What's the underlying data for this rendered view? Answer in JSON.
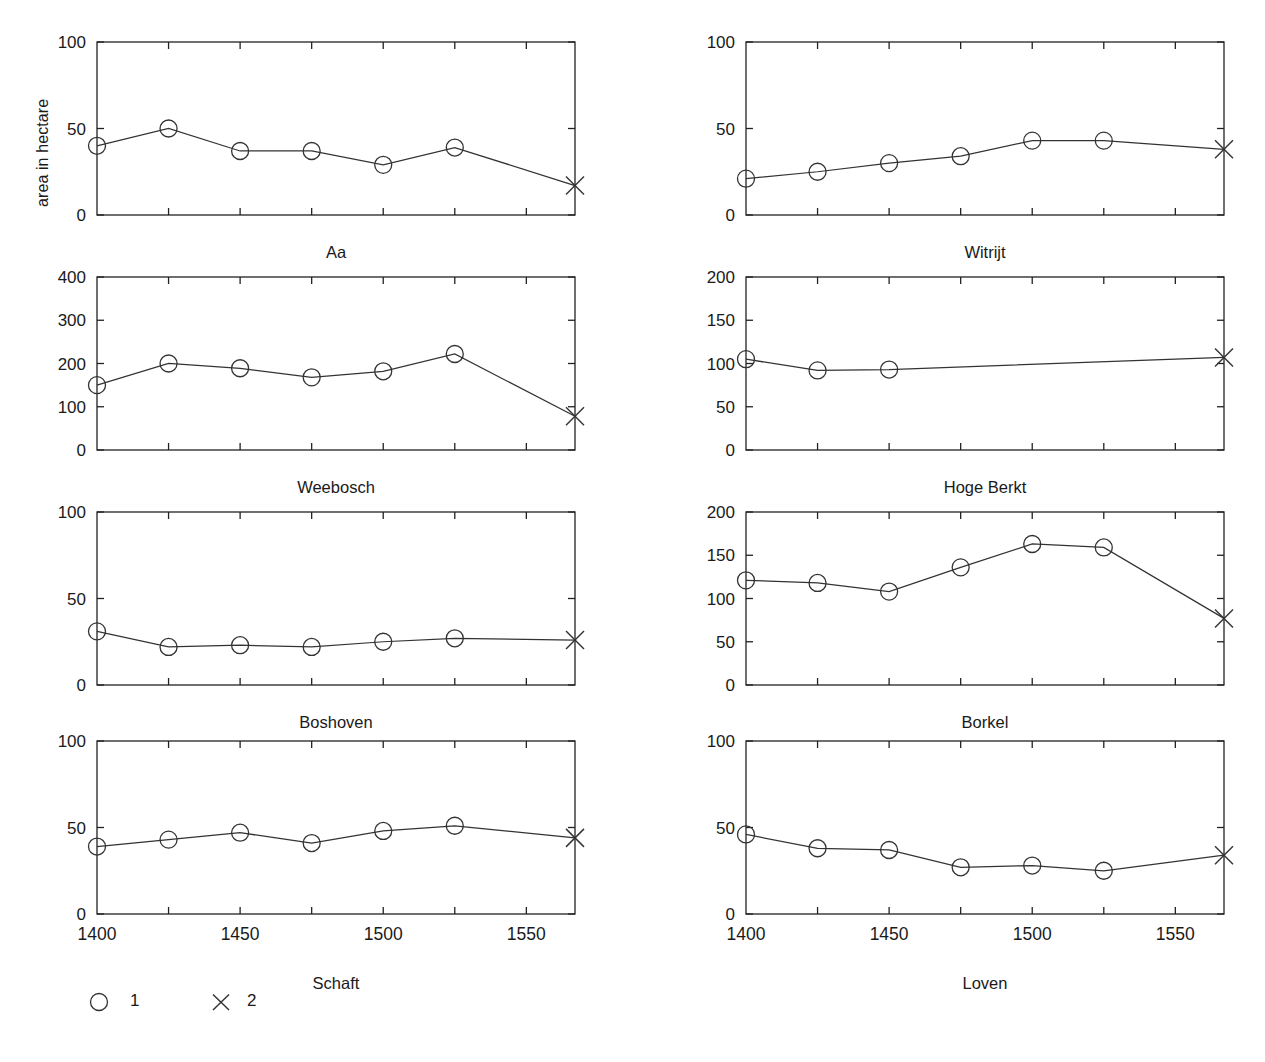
{
  "figure": {
    "ylabel": "area in hectare",
    "xaxis_labels": [
      "1400",
      "1450",
      "1500",
      "1550"
    ],
    "legend": [
      {
        "symbol": "circle",
        "label": "1"
      },
      {
        "symbol": "cross",
        "label": "2"
      }
    ],
    "caption": ""
  },
  "chart_data": {
    "type": "line",
    "title": "",
    "xlabel": "",
    "ylabel": "area in hectare",
    "xlim": [
      1400,
      1567
    ],
    "xticks": [
      1400,
      1450,
      1500,
      1550
    ],
    "xticks_minor": [
      1400,
      1425,
      1450,
      1475,
      1500,
      1525,
      1550
    ],
    "grid": false,
    "legend_position": "bottom-left",
    "series_legend": [
      {
        "name": "1",
        "marker": "circle"
      },
      {
        "name": "2",
        "marker": "cross"
      }
    ],
    "panels": [
      {
        "name": "Aa",
        "ylim": [
          0,
          100
        ],
        "yticks": [
          0,
          50,
          100
        ],
        "ytick_labels": [
          "0",
          "50",
          "100"
        ],
        "series": [
          {
            "name": "1",
            "marker": "circle",
            "x": [
              1400,
              1425,
              1450,
              1475,
              1500,
              1525
            ],
            "values": [
              40,
              50,
              37,
              37,
              29,
              39
            ]
          },
          {
            "name": "2",
            "marker": "cross",
            "x": [
              1567
            ],
            "values": [
              17
            ]
          }
        ]
      },
      {
        "name": "Witrijt",
        "ylim": [
          0,
          100
        ],
        "yticks": [
          0,
          50,
          100
        ],
        "ytick_labels": [
          "0",
          "50",
          "100"
        ],
        "series": [
          {
            "name": "1",
            "marker": "circle",
            "x": [
              1400,
              1425,
              1450,
              1475,
              1500,
              1525
            ],
            "values": [
              21,
              25,
              30,
              34,
              43,
              43
            ]
          },
          {
            "name": "2",
            "marker": "cross",
            "x": [
              1567
            ],
            "values": [
              38
            ]
          }
        ]
      },
      {
        "name": "Weebosch",
        "ylim": [
          0,
          400
        ],
        "yticks": [
          0,
          100,
          200,
          300,
          400
        ],
        "ytick_labels": [
          "0",
          "100",
          "200",
          "300",
          "400"
        ],
        "series": [
          {
            "name": "1",
            "marker": "circle",
            "x": [
              1400,
              1425,
              1450,
              1475,
              1500,
              1525
            ],
            "values": [
              150,
              200,
              189,
              168,
              182,
              222
            ]
          },
          {
            "name": "2",
            "marker": "cross",
            "x": [
              1567
            ],
            "values": [
              78
            ]
          }
        ]
      },
      {
        "name": "Hoge Berkt",
        "ylim": [
          0,
          200
        ],
        "yticks": [
          0,
          50,
          100,
          150,
          200
        ],
        "ytick_labels": [
          "0",
          "50",
          "100",
          "150",
          "200"
        ],
        "series": [
          {
            "name": "1",
            "marker": "circle",
            "x": [
              1400,
              1425,
              1450
            ],
            "values": [
              105,
              92,
              93
            ]
          },
          {
            "name": "2",
            "marker": "cross",
            "x": [
              1567
            ],
            "values": [
              107
            ]
          }
        ]
      },
      {
        "name": "Boshoven",
        "ylim": [
          0,
          100
        ],
        "yticks": [
          0,
          50,
          100
        ],
        "ytick_labels": [
          "0",
          "50",
          "100"
        ],
        "series": [
          {
            "name": "1",
            "marker": "circle",
            "x": [
              1400,
              1425,
              1450,
              1475,
              1500,
              1525
            ],
            "values": [
              31,
              22,
              23,
              22,
              25,
              27
            ]
          },
          {
            "name": "2",
            "marker": "cross",
            "x": [
              1567
            ],
            "values": [
              26
            ]
          }
        ]
      },
      {
        "name": "Borkel",
        "ylim": [
          0,
          200
        ],
        "yticks": [
          0,
          50,
          100,
          150,
          200
        ],
        "ytick_labels": [
          "0",
          "50",
          "100",
          "150",
          "200"
        ],
        "series": [
          {
            "name": "1",
            "marker": "circle",
            "x": [
              1400,
              1425,
              1450,
              1475,
              1500,
              1525
            ],
            "values": [
              121,
              118,
              108,
              136,
              163,
              159
            ]
          },
          {
            "name": "2",
            "marker": "cross",
            "x": [
              1567
            ],
            "values": [
              77
            ]
          }
        ]
      },
      {
        "name": "Schaft",
        "ylim": [
          0,
          100
        ],
        "yticks": [
          0,
          50,
          100
        ],
        "ytick_labels": [
          "0",
          "50",
          "100"
        ],
        "show_xticks": true,
        "series": [
          {
            "name": "1",
            "marker": "circle",
            "x": [
              1400,
              1425,
              1450,
              1475,
              1500,
              1525
            ],
            "values": [
              39,
              43,
              47,
              41,
              48,
              51
            ]
          },
          {
            "name": "2",
            "marker": "cross",
            "x": [
              1567
            ],
            "values": [
              44
            ]
          }
        ]
      },
      {
        "name": "Loven",
        "ylim": [
          0,
          100
        ],
        "yticks": [
          0,
          50,
          100
        ],
        "ytick_labels": [
          "0",
          "50",
          "100"
        ],
        "show_xticks": true,
        "series": [
          {
            "name": "1",
            "marker": "circle",
            "x": [
              1400,
              1425,
              1450,
              1475,
              1500,
              1525
            ],
            "values": [
              46,
              38,
              37,
              27,
              28,
              25
            ]
          },
          {
            "name": "2",
            "marker": "cross",
            "x": [
              1567
            ],
            "values": [
              34
            ]
          }
        ]
      }
    ]
  }
}
